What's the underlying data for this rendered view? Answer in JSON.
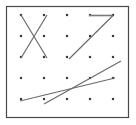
{
  "figure": {
    "canvas": {
      "width": 136,
      "height": 125,
      "background": "#ffffff"
    },
    "frame": {
      "x": 6.5,
      "y": 6.5,
      "width": 122,
      "height": 111,
      "stroke": "#4a4a4a",
      "stroke_width": 1.2,
      "fill": "#ffffff"
    },
    "dot_grid": {
      "rows": 5,
      "cols": 5,
      "x_positions": [
        21,
        44,
        67,
        90,
        113
      ],
      "y_positions": [
        15,
        36,
        57,
        78,
        99
      ],
      "dot_size": 2.2,
      "color": "#3c3c3c"
    },
    "lines": [
      {
        "name": "x-stroke-down-right",
        "x1": 21,
        "y1": 15,
        "x2": 47,
        "y2": 58,
        "stroke": "#6b6b6b",
        "stroke_width": 1.2
      },
      {
        "name": "x-stroke-down-left",
        "x1": 47,
        "y1": 15,
        "x2": 21,
        "y2": 58,
        "stroke": "#6b6b6b",
        "stroke_width": 1.2
      },
      {
        "name": "seven-top-horizontal",
        "x1": 89,
        "y1": 15.5,
        "x2": 113,
        "y2": 15.5,
        "stroke": "#7a7a7a",
        "stroke_width": 1.6
      },
      {
        "name": "seven-diagonal",
        "x1": 113,
        "y1": 15.5,
        "x2": 69,
        "y2": 59,
        "stroke": "#6b6b6b",
        "stroke_width": 1.2
      },
      {
        "name": "lower-steep-rising-line",
        "x1": 44,
        "y1": 104,
        "x2": 121,
        "y2": 61,
        "stroke": "#6b6b6b",
        "stroke_width": 1.2
      },
      {
        "name": "lower-shallow-rising-line",
        "x1": 20,
        "y1": 101,
        "x2": 115,
        "y2": 78,
        "stroke": "#6b6b6b",
        "stroke_width": 1.2
      }
    ]
  }
}
